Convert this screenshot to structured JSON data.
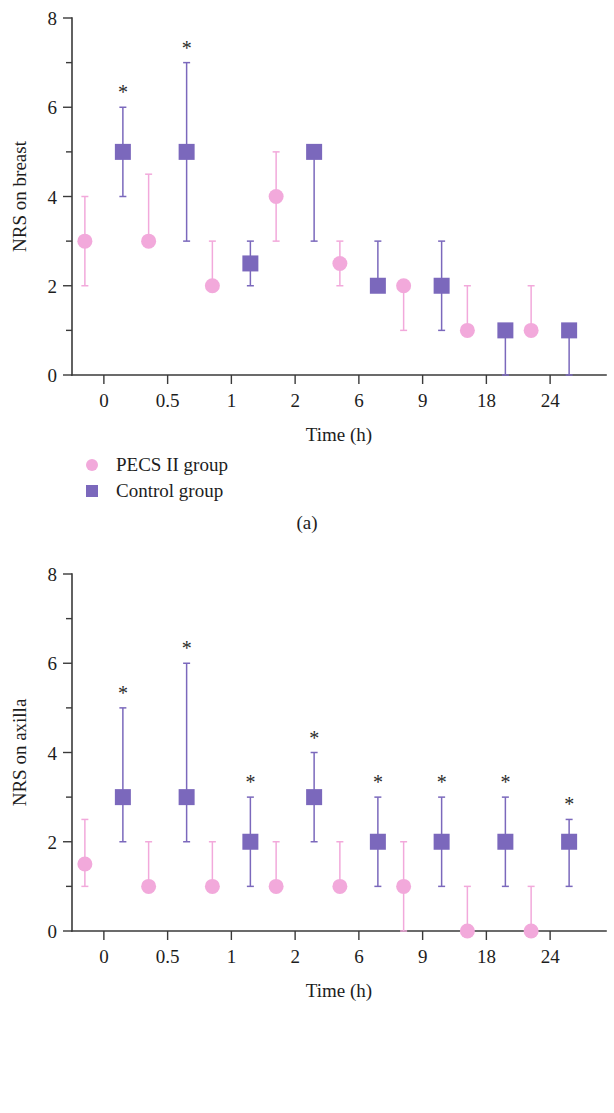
{
  "figure": {
    "panels": [
      {
        "id": "a",
        "caption": "(a)",
        "ylabel": "NRS on breast",
        "xlabel": "Time (h)"
      },
      {
        "id": "b",
        "caption": "(b)",
        "ylabel": "NRS on axilla",
        "xlabel": "Time (h)"
      }
    ]
  },
  "legend": {
    "entries": [
      {
        "label": "PECS II group",
        "marker": "circle",
        "color": "#f2a9db"
      },
      {
        "label": "Control group",
        "marker": "square",
        "color": "#7b68bc"
      }
    ]
  },
  "colors": {
    "pecs": "#f2a9db",
    "control": "#7b68bc",
    "axis": "#3a3a3a",
    "star": "#2b2b2b",
    "background": "#ffffff"
  },
  "chart_data": [
    {
      "type": "scatter",
      "panel": "a",
      "title": "",
      "xlabel": "Time (h)",
      "ylabel": "NRS on breast",
      "categories": [
        "0",
        "0.5",
        "1",
        "2",
        "6",
        "9",
        "18",
        "24"
      ],
      "yticks": [
        0,
        2,
        4,
        6,
        8
      ],
      "yminorticks": [
        1,
        3,
        5,
        7
      ],
      "ylim": [
        0,
        8
      ],
      "grid": false,
      "legend_position": "below-left",
      "error_bar_type": "interquartile range",
      "series": [
        {
          "name": "PECS II group",
          "marker": "circle",
          "color": "#f2a9db",
          "values": [
            3,
            3,
            2,
            4,
            2.5,
            2,
            1,
            1
          ],
          "err_low": [
            2,
            3,
            2,
            3,
            2,
            1,
            1,
            1
          ],
          "err_high": [
            4,
            4.5,
            3,
            5,
            3,
            2,
            2,
            2
          ],
          "significant": [
            false,
            false,
            false,
            false,
            false,
            false,
            false,
            false
          ]
        },
        {
          "name": "Control group",
          "marker": "square",
          "color": "#7b68bc",
          "values": [
            5,
            5,
            2.5,
            5,
            2,
            2,
            1,
            1
          ],
          "err_low": [
            4,
            3,
            2,
            3,
            2,
            1,
            0,
            0
          ],
          "err_high": [
            6,
            7,
            3,
            5,
            3,
            3,
            1,
            1
          ],
          "significant": [
            true,
            true,
            false,
            false,
            false,
            false,
            false,
            false
          ]
        }
      ]
    },
    {
      "type": "scatter",
      "panel": "b",
      "title": "",
      "xlabel": "Time (h)",
      "ylabel": "NRS on axilla",
      "categories": [
        "0",
        "0.5",
        "1",
        "2",
        "6",
        "9",
        "18",
        "24"
      ],
      "yticks": [
        0,
        2,
        4,
        6,
        8
      ],
      "yminorticks": [
        1,
        3,
        5,
        7
      ],
      "ylim": [
        0,
        8
      ],
      "grid": false,
      "legend_position": "below-left",
      "error_bar_type": "interquartile range",
      "series": [
        {
          "name": "PECS II group",
          "marker": "circle",
          "color": "#f2a9db",
          "values": [
            1.5,
            1,
            1,
            1,
            1,
            1,
            0,
            0
          ],
          "err_low": [
            1,
            1,
            1,
            1,
            1,
            0,
            0,
            0
          ],
          "err_high": [
            2.5,
            2,
            2,
            2,
            2,
            2,
            1,
            1
          ],
          "significant": [
            false,
            false,
            false,
            false,
            false,
            false,
            false,
            false
          ]
        },
        {
          "name": "Control group",
          "marker": "square",
          "color": "#7b68bc",
          "values": [
            3,
            3,
            2,
            3,
            2,
            2,
            2,
            2
          ],
          "err_low": [
            2,
            2,
            1,
            2,
            1,
            1,
            1,
            1
          ],
          "err_high": [
            5,
            6,
            3,
            4,
            3,
            3,
            3,
            2.5
          ],
          "significant": [
            true,
            true,
            true,
            true,
            true,
            true,
            true,
            true
          ]
        }
      ]
    }
  ],
  "annotations": {
    "significance_marker": "*"
  }
}
